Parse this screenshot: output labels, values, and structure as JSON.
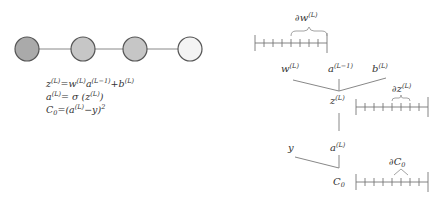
{
  "network": {
    "nodes": [
      {
        "id": "n1",
        "fill": "#aaaaaa"
      },
      {
        "id": "n2",
        "fill": "#c6c6c6"
      },
      {
        "id": "n3",
        "fill": "#c6c6c6"
      },
      {
        "id": "n4",
        "fill": "#f4f4f4"
      }
    ],
    "stroke": "#555555"
  },
  "equations": {
    "line1": {
      "z": "z",
      "zsup": "(L)",
      "eq": "=",
      "w": "w",
      "wsup": "(L)",
      "a": "a",
      "asup": "(L−1)",
      "plus": "+",
      "b": "b",
      "bsup": "(L)"
    },
    "line2": {
      "a": "a",
      "asup": "(L)",
      "eq": "= σ (",
      "z": "z",
      "zsup": "(L)",
      "close": ")"
    },
    "line3": {
      "c": "C",
      "csub": "0",
      "eq": "=(",
      "a": "a",
      "asup": "(L)",
      "minus": "−y)",
      "sq": "2"
    }
  },
  "graph": {
    "w": {
      "base": "w",
      "sup": "(L)"
    },
    "a_prev": {
      "base": "a",
      "sup": "(L−1)"
    },
    "b": {
      "base": "b",
      "sup": "(L)"
    },
    "z": {
      "base": "z",
      "sup": "(L)"
    },
    "y": {
      "base": "y"
    },
    "a": {
      "base": "a",
      "sup": "(L)"
    },
    "c0": {
      "base": "C",
      "sub": "0"
    }
  },
  "rulers": {
    "dw": {
      "partial": "∂",
      "base": "w",
      "sup": "(L)"
    },
    "dz": {
      "partial": "∂",
      "base": "z",
      "sup": "(L)"
    },
    "dc": {
      "partial": "∂",
      "base": "C",
      "sub": "0"
    }
  }
}
